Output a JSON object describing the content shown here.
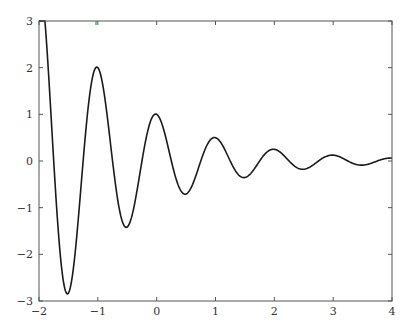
{
  "chart_data": {
    "type": "line",
    "title": "",
    "xlabel": "",
    "ylabel": "",
    "xlim": [
      -2,
      4
    ],
    "ylim": [
      -3,
      3
    ],
    "grid": false,
    "legend": null,
    "x_ticks": [
      "-2",
      "-1",
      "0",
      "1",
      "2",
      "3",
      "4"
    ],
    "y_ticks": [
      "3",
      "2",
      "1",
      "0",
      "-1",
      "-2",
      "-3"
    ],
    "function_hint": "y = 2^(-x) * cos(2*pi*x), clipped to [-3, 3]",
    "series": [
      {
        "name": "damped oscillation",
        "color": "#1a1a1a",
        "key_points": [
          {
            "x": -2.0,
            "y": 3.0
          },
          {
            "x": -1.55,
            "y": -2.74
          },
          {
            "x": -1.05,
            "y": 1.93
          },
          {
            "x": -0.52,
            "y": -1.4
          },
          {
            "x": -0.03,
            "y": 0.97
          },
          {
            "x": 0.52,
            "y": -0.72
          },
          {
            "x": 1.03,
            "y": 0.52
          },
          {
            "x": 1.55,
            "y": -0.36
          },
          {
            "x": 2.06,
            "y": 0.26
          },
          {
            "x": 2.55,
            "y": -0.18
          },
          {
            "x": 3.05,
            "y": 0.13
          },
          {
            "x": 3.55,
            "y": -0.09
          },
          {
            "x": 4.0,
            "y": 0.06
          }
        ]
      }
    ]
  },
  "colors": {
    "axis": "#555555",
    "curve": "#1a1a1a",
    "marker_tick": "#4caf50"
  }
}
